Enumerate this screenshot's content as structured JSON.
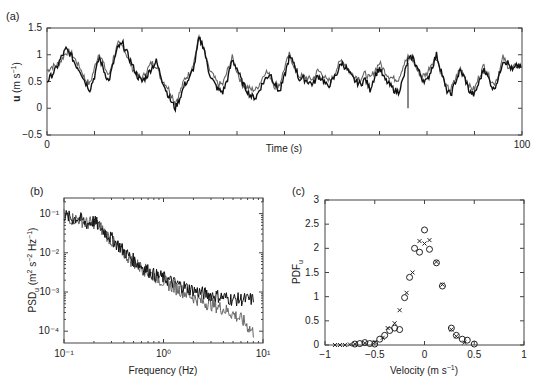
{
  "figure": {
    "panels": [
      "(a)",
      "(b)",
      "(c)"
    ]
  },
  "chart_data": [
    {
      "panel": "(a)",
      "type": "line",
      "title": "",
      "xlabel": "Time (s)",
      "ylabel": "u (m s⁻¹)",
      "ylabel_bold_symbol": "u",
      "ylabel_units": "(m s",
      "xlim": [
        0,
        100
      ],
      "ylim": [
        -0.5,
        1.5
      ],
      "xticks_labeled": [
        0,
        100
      ],
      "yticks": [
        -0.5,
        0,
        0.5,
        1,
        1.5
      ],
      "ytick_labels": [
        "−0.5",
        "0",
        "0.5",
        "1",
        "1.5"
      ],
      "grid": false,
      "series": [
        {
          "name": "series-1 (black)",
          "color": "#111111",
          "x": [
            0,
            1,
            2,
            3,
            4,
            5,
            6,
            7,
            8,
            9,
            10,
            11,
            12,
            13,
            14,
            15,
            16,
            17,
            18,
            19,
            20,
            21,
            22,
            23,
            24,
            25,
            26,
            27,
            28,
            29,
            30,
            31,
            32,
            33,
            34,
            35,
            36,
            37,
            38,
            39,
            40,
            41,
            42,
            43,
            44,
            45,
            46,
            47,
            48,
            49,
            50,
            51,
            52,
            53,
            54,
            55,
            56,
            57,
            58,
            59,
            60,
            61,
            62,
            63,
            64,
            65,
            66,
            67,
            68,
            69,
            70,
            71,
            72,
            73,
            74,
            75,
            76,
            77,
            78,
            79,
            80,
            81,
            82,
            83,
            84,
            85,
            86,
            87,
            88,
            89,
            90,
            91,
            92,
            93,
            94,
            95,
            96,
            97,
            98,
            99,
            100
          ],
          "y": [
            0.5,
            0.62,
            0.75,
            0.95,
            1.1,
            1.0,
            0.82,
            0.7,
            0.5,
            0.35,
            0.6,
            0.95,
            0.7,
            0.5,
            0.85,
            1.15,
            1.2,
            1.0,
            0.8,
            0.6,
            0.5,
            0.6,
            0.75,
            0.88,
            0.6,
            0.35,
            0.15,
            0.0,
            0.2,
            0.45,
            0.55,
            0.8,
            1.3,
            1.15,
            0.7,
            0.5,
            0.35,
            0.3,
            0.55,
            0.9,
            0.75,
            0.5,
            0.35,
            0.22,
            0.2,
            0.4,
            0.55,
            0.65,
            0.45,
            0.3,
            0.6,
            0.95,
            0.85,
            0.55,
            0.55,
            0.5,
            0.45,
            0.6,
            0.55,
            0.4,
            0.5,
            0.65,
            0.85,
            0.75,
            0.6,
            0.5,
            0.45,
            0.55,
            0.35,
            0.6,
            0.75,
            0.55,
            0.45,
            0.35,
            0.3,
            0.55,
            0.9,
            0.95,
            0.75,
            0.55,
            0.5,
            0.75,
            1.0,
            0.7,
            0.35,
            0.25,
            0.5,
            0.7,
            0.55,
            0.3,
            0.25,
            0.5,
            0.75,
            0.55,
            0.35,
            0.55,
            0.9,
            0.85,
            0.7,
            0.8,
            0.75
          ]
        },
        {
          "name": "series-2 (gray)",
          "color": "#666666",
          "x": [
            0,
            1,
            2,
            3,
            4,
            5,
            6,
            7,
            8,
            9,
            10,
            11,
            12,
            13,
            14,
            15,
            16,
            17,
            18,
            19,
            20,
            21,
            22,
            23,
            24,
            25,
            26,
            27,
            28,
            29,
            30,
            31,
            32,
            33,
            34,
            35,
            36,
            37,
            38,
            39,
            40,
            41,
            42,
            43,
            44,
            45,
            46,
            47,
            48,
            49,
            50,
            51,
            52,
            53,
            54,
            55,
            56,
            57,
            58,
            59,
            60,
            61,
            62,
            63,
            64,
            65,
            66,
            67,
            68,
            69,
            70,
            71,
            72,
            73,
            74,
            75,
            76,
            77,
            78,
            79,
            80,
            81,
            82,
            83,
            84,
            85,
            86,
            87,
            88,
            89,
            90,
            91,
            92,
            93,
            94,
            95,
            96,
            97,
            98,
            99,
            100
          ],
          "y": [
            0.7,
            0.78,
            0.8,
            0.9,
            1.05,
            1.05,
            0.9,
            0.75,
            0.55,
            0.45,
            0.75,
            1.05,
            0.8,
            0.6,
            0.95,
            1.2,
            1.15,
            0.95,
            0.75,
            0.62,
            0.55,
            0.7,
            0.85,
            0.8,
            0.55,
            0.45,
            0.3,
            0.1,
            0.3,
            0.55,
            0.65,
            0.9,
            1.35,
            1.1,
            0.75,
            0.6,
            0.45,
            0.45,
            0.7,
            0.95,
            0.7,
            0.45,
            0.4,
            0.35,
            0.35,
            0.5,
            0.7,
            0.6,
            0.4,
            0.45,
            0.75,
            1.0,
            0.8,
            0.6,
            0.6,
            0.55,
            0.55,
            0.7,
            0.65,
            0.5,
            0.55,
            0.75,
            0.9,
            0.8,
            0.65,
            0.6,
            0.55,
            0.65,
            0.55,
            0.7,
            0.85,
            0.7,
            0.6,
            0.55,
            0.55,
            0.8,
            0.95,
            0.9,
            0.7,
            0.6,
            0.65,
            0.85,
            0.95,
            0.65,
            0.4,
            0.35,
            0.55,
            0.75,
            0.6,
            0.4,
            0.35,
            0.6,
            0.8,
            0.6,
            0.45,
            0.6,
            0.95,
            0.8,
            0.75,
            0.8,
            0.78
          ]
        }
      ],
      "annotations": [
        "spike near t≈76 s down to about 0"
      ]
    },
    {
      "panel": "(b)",
      "type": "line",
      "title": "",
      "xlabel": "Frequency (Hz)",
      "ylabel": "PSD_u (m² s⁻² Hz⁻¹)",
      "xscale": "log",
      "yscale": "log",
      "xlim": [
        0.1,
        10
      ],
      "ylim": [
        5e-05,
        0.25
      ],
      "xticks": [
        0.1,
        1,
        10
      ],
      "xtick_labels": [
        "10⁻¹",
        "10⁰",
        "10¹"
      ],
      "yticks": [
        0.0001,
        0.001,
        0.01,
        0.1
      ],
      "ytick_labels": [
        "10⁻⁴",
        "10⁻³",
        "10⁻²",
        "10⁻¹"
      ],
      "grid": false,
      "series": [
        {
          "name": "series-1 (black)",
          "color": "#111111",
          "x": [
            0.1,
            0.12,
            0.14,
            0.17,
            0.2,
            0.25,
            0.3,
            0.4,
            0.5,
            0.6,
            0.8,
            1.0,
            1.3,
            1.6,
            2.0,
            2.5,
            3.2,
            4.0,
            5.0,
            6.3,
            8.0
          ],
          "y": [
            0.1,
            0.08,
            0.085,
            0.06,
            0.07,
            0.04,
            0.025,
            0.012,
            0.007,
            0.005,
            0.003,
            0.0025,
            0.0018,
            0.0015,
            0.0012,
            0.001,
            0.0009,
            0.0008,
            0.0007,
            0.0007,
            0.0007
          ]
        },
        {
          "name": "series-2 (gray)",
          "color": "#666666",
          "x": [
            0.1,
            0.12,
            0.14,
            0.17,
            0.2,
            0.25,
            0.3,
            0.4,
            0.5,
            0.6,
            0.8,
            1.0,
            1.3,
            1.6,
            2.0,
            2.5,
            3.2,
            4.0,
            5.0,
            6.3,
            8.0
          ],
          "y": [
            0.1,
            0.08,
            0.08,
            0.06,
            0.065,
            0.04,
            0.022,
            0.011,
            0.006,
            0.0045,
            0.0028,
            0.002,
            0.0014,
            0.0011,
            0.0008,
            0.0006,
            0.0005,
            0.0004,
            0.0003,
            0.0002,
            0.0001
          ]
        }
      ]
    },
    {
      "panel": "(c)",
      "type": "scatter",
      "title": "",
      "xlabel": "Velocity (m s⁻¹)",
      "ylabel": "PDF_u",
      "xlim": [
        -1,
        1
      ],
      "ylim": [
        0,
        3
      ],
      "xticks": [
        -1,
        -0.5,
        0,
        0.5,
        1
      ],
      "xtick_labels": [
        "−1",
        "−0.5",
        "0",
        "0.5",
        "1"
      ],
      "yticks": [
        0,
        0.5,
        1,
        1.5,
        2,
        2.5,
        3
      ],
      "ytick_labels": [
        "0",
        "0.5",
        "1",
        "1.5",
        "2",
        "2.5",
        "3"
      ],
      "grid": false,
      "series": [
        {
          "name": "circles",
          "marker": "o",
          "x": [
            -0.7,
            -0.65,
            -0.6,
            -0.55,
            -0.5,
            -0.45,
            -0.4,
            -0.35,
            -0.3,
            -0.25,
            -0.2,
            -0.15,
            -0.1,
            -0.05,
            0.0,
            0.05,
            0.12,
            0.18,
            0.27,
            0.32,
            0.38,
            0.43,
            0.5
          ],
          "y": [
            0.02,
            0.03,
            0.05,
            0.03,
            0.02,
            0.12,
            0.2,
            0.3,
            0.35,
            0.32,
            0.98,
            1.4,
            2.0,
            1.92,
            2.38,
            1.98,
            1.7,
            1.22,
            0.35,
            0.2,
            0.12,
            0.1,
            0.02
          ]
        },
        {
          "name": "crosses",
          "marker": "x",
          "x": [
            -0.9,
            -0.85,
            -0.8,
            -0.75,
            -0.7,
            -0.6,
            -0.5,
            -0.42,
            -0.37,
            -0.3,
            -0.25,
            -0.18,
            -0.12,
            -0.05,
            0.0,
            0.05,
            0.12,
            0.18,
            0.27,
            0.32,
            0.4
          ],
          "y": [
            0.0,
            0.0,
            0.0,
            0.01,
            0.02,
            0.04,
            0.06,
            0.15,
            0.35,
            0.45,
            0.72,
            1.08,
            1.5,
            2.15,
            2.1,
            2.17,
            1.72,
            1.25,
            0.32,
            0.18,
            0.05
          ]
        }
      ]
    }
  ]
}
